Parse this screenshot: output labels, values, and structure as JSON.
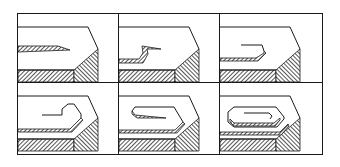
{
  "figure": {
    "title": "",
    "layout": {
      "rows": 2,
      "cols": 3
    },
    "colors": {
      "line": "#1a1a1a",
      "hatch": "#3a3a3a",
      "background": "#ffffff"
    },
    "panels": [
      {
        "step": 1,
        "state": "flat-tapered-edge"
      },
      {
        "step": 2,
        "state": "edge-bent-upward"
      },
      {
        "step": 3,
        "state": "edge-folded-back"
      },
      {
        "step": 4,
        "state": "curl-forming"
      },
      {
        "step": 5,
        "state": "folded-over-flat"
      },
      {
        "step": 6,
        "state": "full-roll-hem"
      }
    ]
  }
}
